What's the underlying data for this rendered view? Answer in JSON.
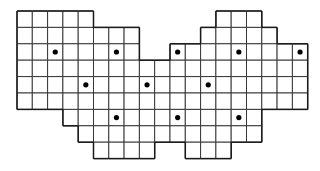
{
  "figure": {
    "background_color": "#ffffff",
    "grid_line_color": "#2b2b2b",
    "outline_color": "#1a1a1a",
    "marker_color": "#000000"
  },
  "lattice": {
    "origin_x": 17,
    "origin_y": 11,
    "cell_width": 15.3,
    "cell_height": 16.4,
    "columns": 19,
    "rows": 9,
    "marker_radius": 2.6,
    "row_labels": [
      "1",
      "2",
      "3",
      "4",
      "5",
      "6",
      "7",
      "8",
      "9"
    ],
    "column_labels": [
      "1",
      "2",
      "3",
      "4",
      "5",
      "6",
      "7",
      "8",
      "9",
      "10",
      "11",
      "12",
      "13",
      "14",
      "15",
      "16",
      "17",
      "18",
      "19"
    ]
  },
  "rows": [
    {
      "index": 0,
      "runs": [
        {
          "start": 0,
          "end": 5
        },
        {
          "start": 13,
          "end": 16
        }
      ]
    },
    {
      "index": 1,
      "runs": [
        {
          "start": 0,
          "end": 8
        },
        {
          "start": 12,
          "end": 17
        }
      ]
    },
    {
      "index": 2,
      "runs": [
        {
          "start": 0,
          "end": 8
        },
        {
          "start": 10,
          "end": 19
        }
      ]
    },
    {
      "index": 3,
      "runs": [
        {
          "start": 0,
          "end": 19
        }
      ]
    },
    {
      "index": 4,
      "runs": [
        {
          "start": 0,
          "end": 19
        }
      ]
    },
    {
      "index": 5,
      "runs": [
        {
          "start": 0,
          "end": 19
        }
      ]
    },
    {
      "index": 6,
      "runs": [
        {
          "start": 3,
          "end": 16
        }
      ]
    },
    {
      "index": 7,
      "runs": [
        {
          "start": 4,
          "end": 16
        }
      ]
    },
    {
      "index": 8,
      "runs": [
        {
          "start": 5,
          "end": 9
        },
        {
          "start": 11,
          "end": 14
        }
      ]
    }
  ],
  "markers": [
    {
      "id": "m1",
      "col": 2,
      "row": 2,
      "label": "dot-r3-c3"
    },
    {
      "id": "m2",
      "col": 6,
      "row": 2,
      "label": "dot-r3-c7"
    },
    {
      "id": "m3",
      "col": 10,
      "row": 2,
      "label": "dot-r3-c11"
    },
    {
      "id": "m4",
      "col": 14,
      "row": 2,
      "label": "dot-r3-c15"
    },
    {
      "id": "m5",
      "col": 18,
      "row": 2,
      "label": "dot-r3-c19"
    },
    {
      "id": "m6",
      "col": 4,
      "row": 4,
      "label": "dot-r5-c5"
    },
    {
      "id": "m7",
      "col": 8,
      "row": 4,
      "label": "dot-r5-c9"
    },
    {
      "id": "m8",
      "col": 12,
      "row": 4,
      "label": "dot-r5-c13"
    },
    {
      "id": "m9",
      "col": 6,
      "row": 6,
      "label": "dot-r7-c7"
    },
    {
      "id": "m10",
      "col": 10,
      "row": 6,
      "label": "dot-r7-c11"
    },
    {
      "id": "m11",
      "col": 14,
      "row": 6,
      "label": "dot-r7-c15"
    }
  ],
  "counts": {
    "total_cells": "121",
    "total_markers": "11"
  }
}
